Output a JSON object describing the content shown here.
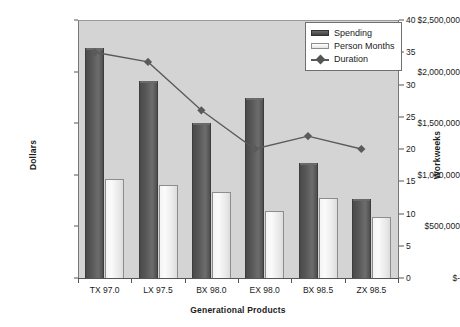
{
  "chart_data": {
    "type": "bar",
    "title": "",
    "subtitle": "",
    "xlabel": "Generational Products",
    "ylabel": "Dollars",
    "y2label": "Workweeks",
    "categories": [
      "TX 97.0",
      "LX 97.5",
      "BX 98.0",
      "EX 98.0",
      "BX 98.5",
      "ZX 98.5"
    ],
    "ylim": [
      0,
      2500000
    ],
    "y2lim": [
      0,
      40
    ],
    "yticks": [
      0,
      500000,
      1000000,
      1500000,
      2000000,
      2500000
    ],
    "ytick_labels": [
      "$-",
      "$500,000",
      "$1,000,000",
      "$1,500,000",
      "$2,000,000",
      "$2,500,000"
    ],
    "y2ticks": [
      0,
      5,
      10,
      15,
      20,
      25,
      30,
      35,
      40
    ],
    "y2tick_labels": [
      "0",
      "5",
      "10",
      "15",
      "20",
      "25",
      "30",
      "35",
      "40"
    ],
    "grid": false,
    "legend_position": "top-right",
    "series": [
      {
        "name": "Spending",
        "type": "bar",
        "axis": "left",
        "color": "#555555",
        "values": [
          2230000,
          1910000,
          1500000,
          1745000,
          1115000,
          765000
        ]
      },
      {
        "name": "Person Months",
        "type": "bar",
        "axis": "left",
        "color": "#f2f2f2",
        "values": [
          955000,
          905000,
          830000,
          650000,
          775000,
          590000
        ]
      },
      {
        "name": "Duration",
        "type": "line",
        "axis": "right",
        "color": "#5a5a5a",
        "marker": "diamond",
        "values": [
          35.0,
          33.5,
          26.0,
          20.0,
          22.0,
          20.0
        ]
      }
    ]
  },
  "legend": {
    "items": [
      {
        "label": "Spending"
      },
      {
        "label": "Person Months"
      },
      {
        "label": "Duration"
      }
    ]
  }
}
